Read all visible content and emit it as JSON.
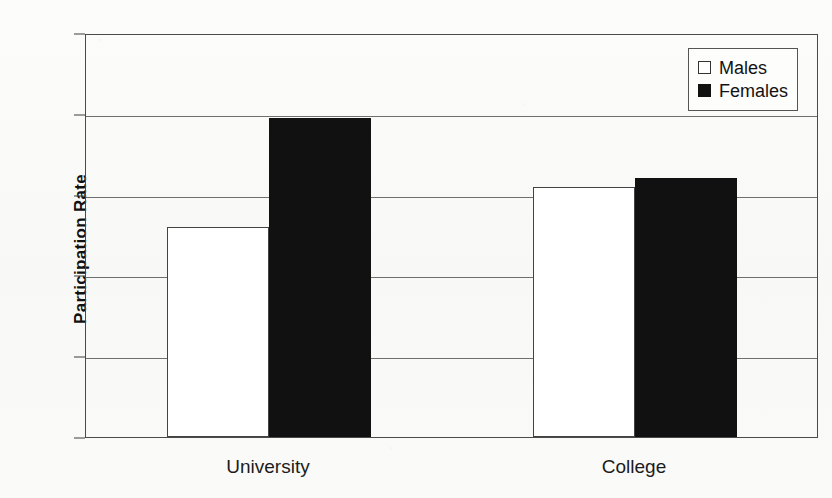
{
  "chart_data": {
    "type": "bar",
    "title": "",
    "xlabel": "",
    "ylabel": "Participation Rate",
    "categories": [
      "University",
      "College"
    ],
    "series": [
      {
        "name": "Males",
        "values": [
          0.26,
          0.31
        ]
      },
      {
        "name": "Females",
        "values": [
          0.395,
          0.32
        ]
      }
    ],
    "ylim": [
      0.0,
      0.5
    ],
    "ytick_labels": [
      "0.5",
      "0.4",
      "0.3",
      "0.2",
      "0.1",
      "0.0"
    ],
    "ytick_values": [
      0.5,
      0.4,
      0.3,
      0.2,
      0.1,
      0.0
    ],
    "grid": "horizontal",
    "legend_position": "top-right",
    "colors": {
      "males": "#ffffff",
      "females": "#111111",
      "axis": "#4a4a4a",
      "grid": "#6f6f6f"
    }
  },
  "legend": {
    "entries": [
      {
        "label": "Males",
        "swatch": "hollow-square"
      },
      {
        "label": "Females",
        "swatch": "solid-square"
      }
    ]
  }
}
